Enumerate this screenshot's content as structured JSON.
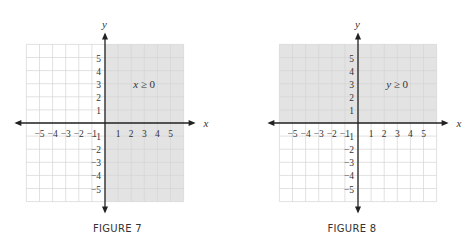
{
  "chart_data": [
    {
      "type": "inequality-region",
      "title": "FIGURE 7",
      "inequality": "x ≥ 0",
      "shaded_region": "right half-plane (x ≥ 0)",
      "xlabel": "x",
      "ylabel": "y",
      "xlim": [
        -6,
        6
      ],
      "ylim": [
        -6,
        6
      ],
      "x_ticks": [
        -5,
        -4,
        -3,
        -2,
        -1,
        1,
        2,
        3,
        4,
        5
      ],
      "y_ticks": [
        5,
        4,
        3,
        2,
        1,
        -1,
        -2,
        -3,
        -4,
        -5
      ],
      "grid": true,
      "shade_color": "#e3e3e3"
    },
    {
      "type": "inequality-region",
      "title": "FIGURE 8",
      "inequality": "y ≥ 0",
      "shaded_region": "upper half-plane (y ≥ 0)",
      "xlabel": "x",
      "ylabel": "y",
      "xlim": [
        -6,
        6
      ],
      "ylim": [
        -6,
        6
      ],
      "x_ticks": [
        -5,
        -4,
        -3,
        -2,
        -1,
        1,
        2,
        3,
        4,
        5
      ],
      "y_ticks": [
        5,
        4,
        3,
        2,
        1,
        -1,
        -2,
        -3,
        -4,
        -5
      ],
      "grid": true,
      "shade_color": "#e3e3e3"
    }
  ],
  "figures": [
    {
      "caption": "FIGURE 7",
      "label": "x ≥ 0",
      "xlabel": "x",
      "ylabel": "y"
    },
    {
      "caption": "FIGURE 8",
      "label": "y ≥ 0",
      "xlabel": "x",
      "ylabel": "y"
    }
  ]
}
